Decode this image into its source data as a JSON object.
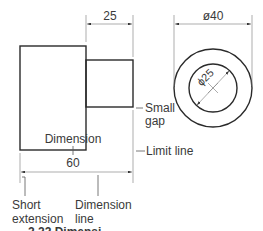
{
  "figure": {
    "dim_length_small": "25",
    "dim_diameter_outer": "ø40",
    "dim_diameter_inner": "ϕ25",
    "dim_length_total": "60",
    "labels": {
      "small_gap_line1": "Small",
      "small_gap_line2": "gap",
      "dimension": "Dimension",
      "limit_line": "Limit line",
      "short_line1": "Short",
      "short_line2": "extension",
      "dimension_line1": "Dimension",
      "dimension_line2": "line"
    },
    "caption": "2.22  Dimensi..."
  }
}
